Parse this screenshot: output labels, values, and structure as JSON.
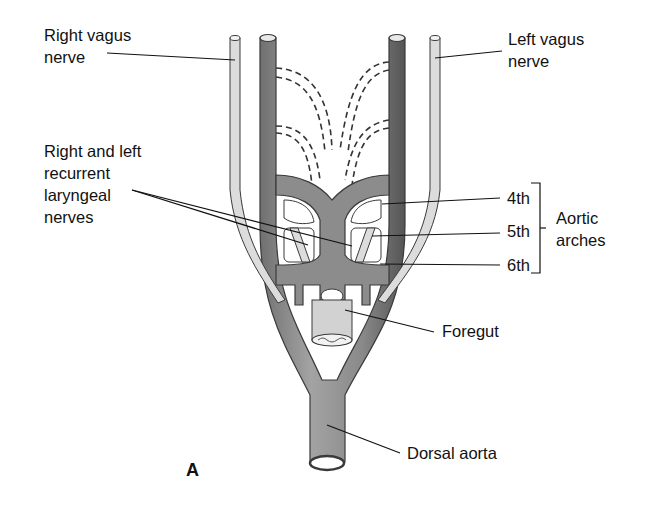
{
  "figure": {
    "panel_letter": "A",
    "labels": {
      "right_vagus": "Right vagus\nnerve",
      "left_vagus": "Left vagus\nnerve",
      "recurrent_laryngeal": "Right and left\nrecurrent\nlaryngeal\nnerves",
      "arch_4": "4th",
      "arch_5": "5th",
      "arch_6": "6th",
      "aortic_arches": "Aortic\narches",
      "foregut": "Foregut",
      "dorsal_aorta": "Dorsal aorta"
    }
  },
  "colors": {
    "vessel_fill": "#8f8f8f",
    "vessel_shadow": "#5f5f5f",
    "vessel_highlight": "#b5b5b5",
    "nerve_fill": "#d9d9d9",
    "outline": "#3a3a3a",
    "leader_line": "#111111",
    "foregut_fill": "#d0d0d0"
  }
}
